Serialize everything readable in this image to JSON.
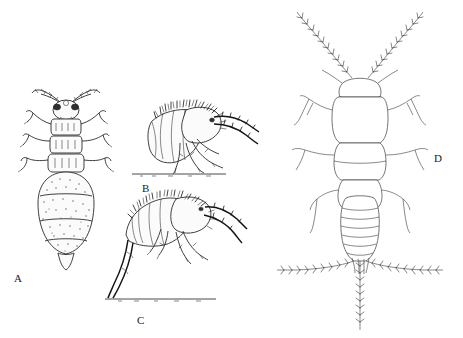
{
  "plate": {
    "title": "Primitive wingless insects — comparative morphology plate",
    "background_color": "#ffffff",
    "ink_color": "#2b2b2b",
    "width": 463,
    "height": 338
  },
  "figures": [
    {
      "id": "A",
      "label": "A",
      "label_x": 14,
      "label_y": 272,
      "view": "dorsal view",
      "description": "Dorsal view of a stout-bodied springtail with stippled shading, paired antennae, dark eye patches, three thoracic segments each with a pair of legs, and a swollen segmented abdomen tapering to a point.",
      "has_ground_line": false,
      "shading": "stippled"
    },
    {
      "id": "B",
      "label": "B",
      "label_x": 142,
      "label_y": 182,
      "view": "lateral view, resting posture",
      "description": "Lateral view of a densely setose springtail standing on a substrate line, with thick dark antennae directed forward and slender legs.",
      "has_ground_line": true,
      "ground_line": {
        "x1": 132,
        "x2": 226,
        "y": 174
      },
      "shading": "dense hatching"
    },
    {
      "id": "C",
      "label": "C",
      "label_x": 137,
      "label_y": 314,
      "view": "lateral view, furcula extended",
      "description": "Lateral view of a springtail in jumping posture with the furcula extended downward from the abdomen tip toward the substrate line.",
      "has_ground_line": true,
      "ground_line": {
        "x1": 105,
        "x2": 216,
        "y": 299
      },
      "shading": "dense hatching"
    },
    {
      "id": "D",
      "label": "D",
      "label_x": 434,
      "label_y": 152,
      "view": "dorsal view",
      "description": "Dorsal outline view of a bristletail-like insect with long barbed antennae, two broad thoracic segments, three pairs of legs, a segmented abdomen and three terminal filaments (two lateral cerci and a median filament) bearing barbed setae.",
      "has_ground_line": false,
      "shading": "line outline"
    }
  ],
  "labels": {
    "a": "A",
    "b": "B",
    "c": "C",
    "d": "D"
  }
}
